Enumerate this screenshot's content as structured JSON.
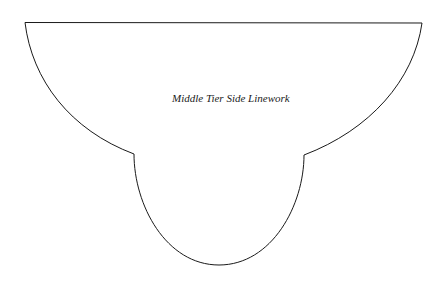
{
  "diagram": {
    "label": "Middle Tier Side Linework",
    "stroke_color": "#1a1a1a",
    "background": "#ffffff"
  }
}
